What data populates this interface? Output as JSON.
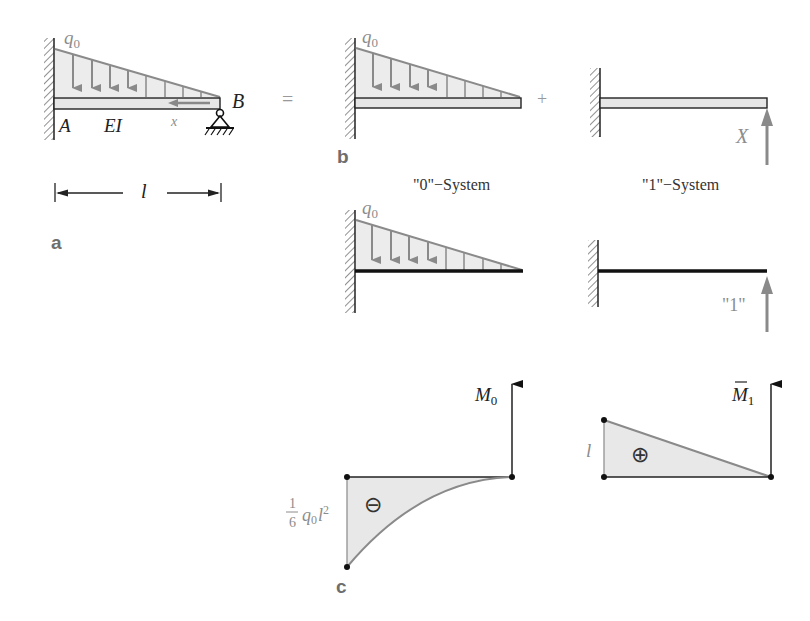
{
  "colors": {
    "load_fill": "#ebebeb",
    "load_stroke": "#8a8a8a",
    "beam_fill": "#e6e6e6",
    "line": "#1a1a1a",
    "gray_text": "#8c8c8c",
    "label_text": "#6e6e6e",
    "diagram_fill": "#e8e8e8"
  },
  "panel_a": {
    "label": "a",
    "load_label": "q",
    "load_sub": "0",
    "point_a": "A",
    "point_b": "B",
    "stiffness": "EI",
    "coord": "x",
    "length": "l"
  },
  "equals": "=",
  "plus": "+",
  "panel_b": {
    "label": "b",
    "load_label": "q",
    "load_sub": "0",
    "force_label": "X",
    "system0_caption": "\"0\"−System",
    "system1_caption": "\"1\"−System",
    "unit_force_label": "\"1\""
  },
  "panel_c": {
    "label": "c",
    "m0_label": "M",
    "m0_sub": "0",
    "m1_label": "M",
    "m1_sub": "1",
    "m0_value_num": "1",
    "m0_value_den": "6",
    "m0_value_expr": "q",
    "m0_value_sub": "0",
    "m0_value_l": "l",
    "m0_value_exp": "2",
    "m0_sign": "⊖",
    "m1_value": "l",
    "m1_sign": "⊕"
  }
}
